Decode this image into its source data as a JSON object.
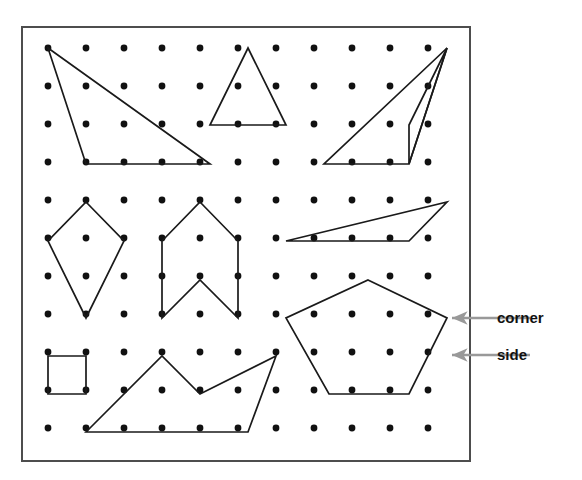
{
  "figure": {
    "caption_top": "",
    "colors": {
      "frame": "#4d4d4d",
      "dot": "#111111",
      "shape_stroke": "#1a1a1a",
      "annotation_arrow": "#999999",
      "label_text": "#111111",
      "background": "#ffffff"
    }
  },
  "board": {
    "frame": {
      "x": 22,
      "y": 27,
      "width": 448,
      "height": 434,
      "stroke_width": 2
    },
    "grid": {
      "columns": 11,
      "rows": 11,
      "origin_x": 48,
      "origin_y": 48,
      "spacing": 38,
      "dot_radius": 3.4
    }
  },
  "shapes": [
    {
      "name": "right-triangle-large",
      "type": "triangle",
      "vertices": [
        [
          48,
          48
        ],
        [
          86,
          164
        ],
        [
          210,
          164
        ]
      ],
      "closed": true
    },
    {
      "name": "isosceles-triangle",
      "type": "triangle",
      "vertices": [
        [
          248,
          48
        ],
        [
          286,
          125
        ],
        [
          210,
          125
        ]
      ],
      "closed": true
    },
    {
      "name": "right-triangle-upper-right",
      "type": "triangle",
      "vertices": [
        [
          447,
          48
        ],
        [
          409,
          164
        ],
        [
          324,
          164
        ]
      ],
      "closed": true
    },
    {
      "name": "thin-triangle-upper-right-inner",
      "type": "triangle",
      "vertices": [
        [
          447,
          48
        ],
        [
          409,
          125
        ],
        [
          409,
          164
        ]
      ],
      "closed": true
    },
    {
      "name": "kite",
      "type": "quadrilateral",
      "vertices": [
        [
          86,
          202
        ],
        [
          124,
          241
        ],
        [
          86,
          318
        ],
        [
          48,
          241
        ]
      ],
      "closed": true
    },
    {
      "name": "concave-arrow-hexagon",
      "type": "hexagon",
      "vertices": [
        [
          200,
          202
        ],
        [
          238,
          241
        ],
        [
          238,
          318
        ],
        [
          200,
          280
        ],
        [
          162,
          318
        ],
        [
          162,
          241
        ]
      ],
      "closed": true
    },
    {
      "name": "thin-scalene-triangle",
      "type": "triangle",
      "vertices": [
        [
          286,
          241
        ],
        [
          409,
          241
        ],
        [
          447,
          202
        ]
      ],
      "closed": true
    },
    {
      "name": "pentagon",
      "type": "pentagon",
      "vertices": [
        [
          368,
          280
        ],
        [
          447,
          318
        ],
        [
          409,
          394
        ],
        [
          329,
          394
        ],
        [
          286,
          318
        ]
      ],
      "closed": true
    },
    {
      "name": "square",
      "type": "square",
      "vertices": [
        [
          48,
          356
        ],
        [
          86,
          356
        ],
        [
          86,
          394
        ],
        [
          48,
          394
        ]
      ],
      "closed": true
    },
    {
      "name": "concave-zigzag-pentagon",
      "type": "pentagon",
      "vertices": [
        [
          86,
          432
        ],
        [
          162,
          356
        ],
        [
          200,
          394
        ],
        [
          276,
          356
        ],
        [
          248,
          432
        ]
      ],
      "closed": true
    }
  ],
  "annotations": [
    {
      "name": "corner",
      "label": "corner",
      "arrow_from": [
        530,
        318
      ],
      "arrow_to": [
        452,
        318
      ],
      "label_x": 497,
      "label_y": 323
    },
    {
      "name": "side",
      "label": "side",
      "arrow_from": [
        530,
        355
      ],
      "arrow_to": [
        452,
        355
      ],
      "label_x": 497,
      "label_y": 360
    }
  ]
}
